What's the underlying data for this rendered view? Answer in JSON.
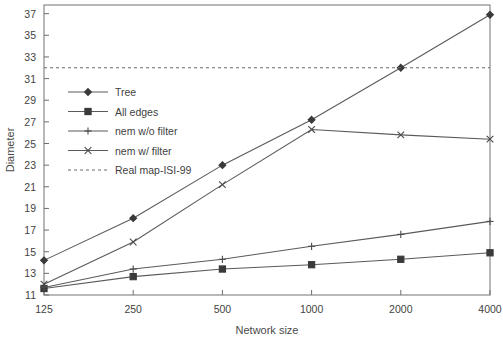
{
  "chart_data": {
    "type": "line",
    "title": "",
    "xlabel": "Network size",
    "ylabel": "Diameter",
    "x": [
      125,
      250,
      500,
      1000,
      2000,
      4000
    ],
    "xticklabels": [
      "125",
      "250",
      "500",
      "1000",
      "2000",
      "4000"
    ],
    "xscale": "log",
    "ylim": [
      11,
      37.8
    ],
    "yticks": [
      11,
      13,
      15,
      17,
      19,
      21,
      23,
      25,
      27,
      29,
      31,
      33,
      35,
      37
    ],
    "yticklabels": [
      "11",
      "13",
      "15",
      "17",
      "19",
      "21",
      "23",
      "25",
      "27",
      "29",
      "31",
      "33",
      "35",
      "37"
    ],
    "grid": false,
    "legend_position": "upper-left-inside",
    "series": [
      {
        "name": "Tree",
        "marker": "diamond",
        "linestyle": "solid",
        "color": "#4a4a4a",
        "values": [
          14.2,
          18.1,
          23.0,
          27.2,
          32.0,
          36.9
        ]
      },
      {
        "name": "All edges",
        "marker": "square",
        "linestyle": "solid",
        "color": "#4a4a4a",
        "values": [
          11.6,
          12.7,
          13.4,
          13.8,
          14.3,
          14.9
        ]
      },
      {
        "name": "nem w/o filter",
        "marker": "plus",
        "linestyle": "solid",
        "color": "#4a4a4a",
        "values": [
          11.7,
          13.4,
          14.3,
          15.5,
          16.6,
          17.8
        ]
      },
      {
        "name": "nem w/ filter",
        "marker": "x",
        "linestyle": "solid",
        "color": "#4a4a4a",
        "values": [
          12.0,
          15.9,
          21.2,
          26.3,
          25.8,
          25.4
        ]
      },
      {
        "name": "Real map-ISI-99",
        "marker": "none",
        "linestyle": "dashed",
        "color": "#6a6a6a",
        "constant_value": 32.0
      }
    ]
  },
  "legend": {
    "items": [
      {
        "label": "Tree",
        "marker": "diamond",
        "linestyle": "solid"
      },
      {
        "label": "All edges",
        "marker": "square",
        "linestyle": "solid"
      },
      {
        "label": "nem w/o filter",
        "marker": "plus",
        "linestyle": "solid"
      },
      {
        "label": "nem w/ filter",
        "marker": "x",
        "linestyle": "solid"
      },
      {
        "label": "Real map-ISI-99",
        "marker": "none",
        "linestyle": "dashed"
      }
    ]
  },
  "colors": {
    "frame": "#8a8a8a",
    "ink": "#4a4a4a",
    "background": "#ffffff"
  }
}
